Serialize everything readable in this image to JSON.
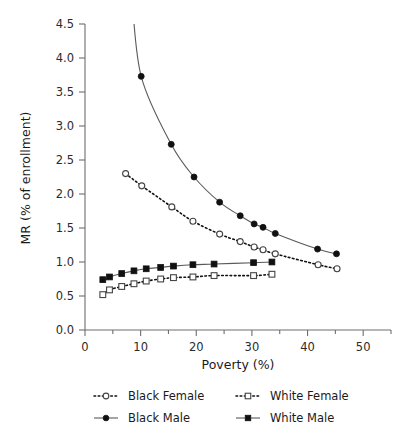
{
  "chart_data": {
    "type": "line",
    "title": "",
    "xlabel": "Poverty (%)",
    "ylabel": "MR (% of enrollment)",
    "xlim": [
      0,
      55
    ],
    "ylim": [
      0.0,
      4.5
    ],
    "xticks": [
      0,
      10,
      20,
      30,
      40,
      50
    ],
    "xticklabels": [
      "0",
      "10",
      "20",
      "30",
      "40",
      "50"
    ],
    "yticks": [
      0.0,
      0.5,
      1.0,
      1.5,
      2.0,
      2.5,
      3.0,
      3.5,
      4.0,
      4.5
    ],
    "yticklabels": [
      "0.0",
      "0.5",
      "1.0",
      "1.5",
      "2.0",
      "2.5",
      "3.0",
      "3.5",
      "4.0",
      "4.5"
    ],
    "grid": false,
    "legend_position": "below",
    "series": [
      {
        "name": "Black Female",
        "marker": "open-circle",
        "linestyle": "dotted",
        "x": [
          7.3,
          10.2,
          15.6,
          19.4,
          24.2,
          27.9,
          30.4,
          32.0,
          34.2,
          41.9,
          45.3
        ],
        "y": [
          2.3,
          2.12,
          1.81,
          1.6,
          1.41,
          1.3,
          1.22,
          1.18,
          1.12,
          0.96,
          0.9
        ]
      },
      {
        "name": "White Female",
        "marker": "open-square",
        "linestyle": "dotted",
        "x": [
          3.2,
          4.4,
          6.6,
          8.8,
          11.0,
          13.6,
          15.9,
          19.4,
          23.2,
          30.3,
          33.6
        ],
        "y": [
          0.52,
          0.59,
          0.64,
          0.68,
          0.72,
          0.75,
          0.77,
          0.78,
          0.8,
          0.8,
          0.82
        ]
      },
      {
        "name": "Black Male",
        "marker": "filled-circle",
        "linestyle": "solid",
        "x": [
          10.1,
          15.5,
          19.6,
          24.2,
          27.9,
          30.4,
          32.0,
          34.2,
          41.8,
          45.2
        ],
        "y": [
          3.73,
          2.73,
          2.25,
          1.88,
          1.68,
          1.56,
          1.51,
          1.42,
          1.19,
          1.12
        ]
      },
      {
        "name": "White Male",
        "marker": "filled-square",
        "linestyle": "solid",
        "x": [
          3.2,
          4.4,
          6.6,
          8.8,
          11.0,
          13.6,
          15.9,
          19.4,
          23.2,
          30.3,
          33.6
        ],
        "y": [
          0.74,
          0.78,
          0.83,
          0.87,
          0.9,
          0.92,
          0.94,
          0.96,
          0.97,
          0.99,
          1.0
        ]
      }
    ]
  },
  "axes": {
    "x_title": "Poverty (%)",
    "y_title": "MR (% of enrollment)"
  },
  "legend": {
    "entries": [
      {
        "label": "Black Female",
        "marker": "open-circle",
        "linestyle": "dotted"
      },
      {
        "label": "White Female",
        "marker": "open-square",
        "linestyle": "dotted"
      },
      {
        "label": "Black Male",
        "marker": "filled-circle",
        "linestyle": "solid"
      },
      {
        "label": "White Male",
        "marker": "filled-square",
        "linestyle": "solid"
      }
    ]
  },
  "colors": {
    "ink": "#111111",
    "axis": "#6e6e6e",
    "background": "#ffffff"
  }
}
